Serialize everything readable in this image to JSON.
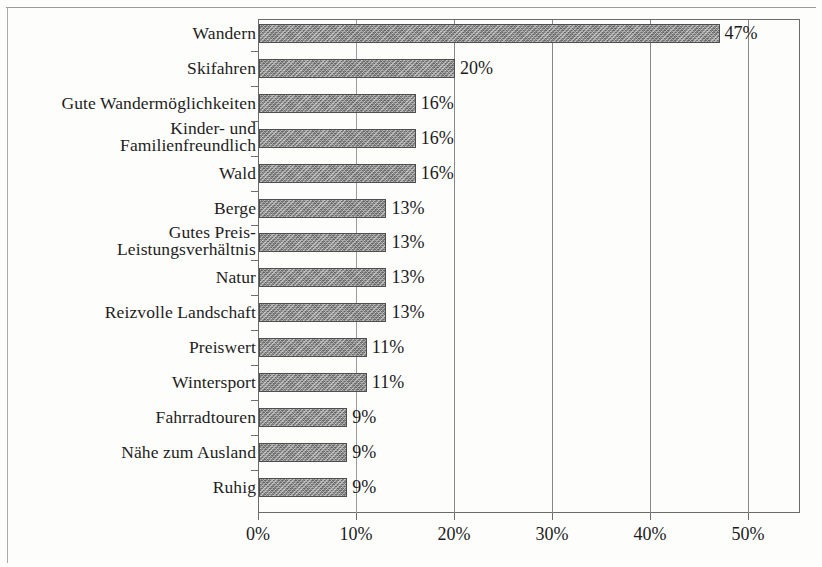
{
  "chart_data": {
    "type": "bar",
    "orientation": "horizontal",
    "title": "",
    "subtitle": "",
    "xlabel": "",
    "ylabel": "",
    "xlim": [
      0,
      55
    ],
    "xticks": [
      "0%",
      "10%",
      "20%",
      "30%",
      "40%",
      "50%"
    ],
    "xtick_values": [
      0,
      10,
      20,
      30,
      40,
      50
    ],
    "grid": "vertical",
    "legend": "none",
    "value_suffix": "%",
    "categories": [
      "Wandern",
      "Skifahren",
      "Gute Wandermöglichkeiten",
      "Kinder- und Familienfreundlich",
      "Wald",
      "Berge",
      "Gutes Preis-Leistungsverhältnis",
      "Natur",
      "Reizvolle Landschaft",
      "Preiswert",
      "Wintersport",
      "Fahrradtouren",
      "Nähe zum Ausland",
      "Ruhig"
    ],
    "values": [
      47,
      20,
      16,
      16,
      16,
      13,
      13,
      13,
      13,
      11,
      11,
      9,
      9,
      9
    ],
    "data_labels": [
      "47%",
      "20%",
      "16%",
      "16%",
      "16%",
      "13%",
      "13%",
      "13%",
      "13%",
      "11%",
      "11%",
      "9%",
      "9%",
      "9%"
    ],
    "category_lines": [
      [
        "Wandern"
      ],
      [
        "Skifahren"
      ],
      [
        "Gute Wandermöglichkeiten"
      ],
      [
        "Kinder- und",
        "Familienfreundlich"
      ],
      [
        "Wald"
      ],
      [
        "Berge"
      ],
      [
        "Gutes Preis-",
        "Leistungsverhältnis"
      ],
      [
        "Natur"
      ],
      [
        "Reizvolle Landschaft"
      ],
      [
        "Preiswert"
      ],
      [
        "Wintersport"
      ],
      [
        "Fahrradtouren"
      ],
      [
        "Nähe zum Ausland"
      ],
      [
        "Ruhig"
      ]
    ],
    "colors": {
      "bar_fill": "#909090",
      "bar_border": "#4e4e4e",
      "axis": "#6b6b6b",
      "grid": "#888888",
      "text": "#1b1b1b",
      "background": "#fdfdfc"
    }
  }
}
